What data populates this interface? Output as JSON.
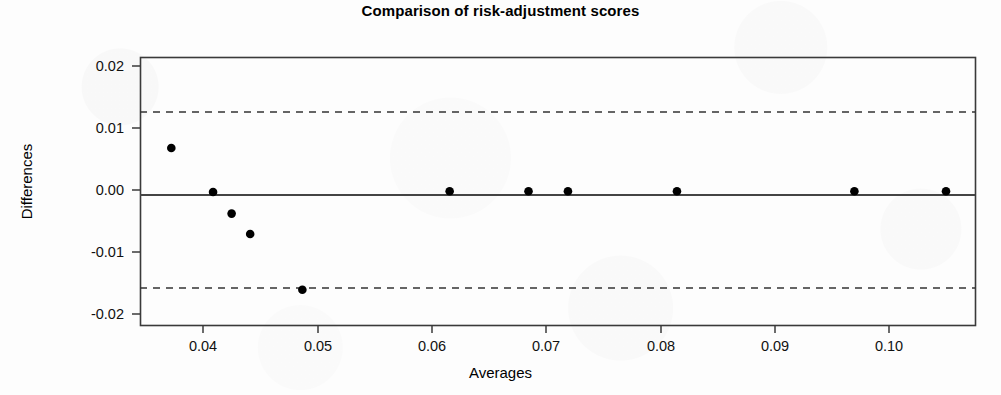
{
  "chart_data": {
    "type": "scatter",
    "title": "Comparison of risk-adjustment scores",
    "xlabel": "Averages",
    "ylabel": "Differences",
    "xlim": [
      0.0347,
      0.1067
    ],
    "ylim": [
      -0.0218,
      0.0215
    ],
    "grid": false,
    "legend": null,
    "xticks": [
      0.04,
      0.05,
      0.06,
      0.07,
      0.08,
      0.09,
      0.1
    ],
    "xtick_labels": [
      "0.04",
      "0.05",
      "0.06",
      "0.07",
      "0.08",
      "0.09",
      "0.10"
    ],
    "yticks": [
      0.02,
      0.01,
      0.0,
      -0.01,
      -0.02
    ],
    "ytick_labels": [
      "0.02",
      "0.01",
      "0.00",
      "-0.01",
      "-0.02"
    ],
    "series": [
      {
        "name": "differences",
        "marker": "filled-circle",
        "color": "#000000",
        "x": [
          0.0374,
          0.041,
          0.0426,
          0.0442,
          0.0487,
          0.0614,
          0.0682,
          0.0716,
          0.081,
          0.0963,
          0.1042
        ],
        "y": [
          0.0068,
          -0.0003,
          -0.0038,
          -0.0071,
          -0.0161,
          -0.0002,
          -0.0002,
          -0.0002,
          -0.0002,
          -0.0002,
          -0.0002
        ]
      }
    ],
    "reference_lines": [
      {
        "name": "upper-limit-of-agreement",
        "value": 0.0126,
        "style": "dashed",
        "color": "#333333"
      },
      {
        "name": "mean-difference",
        "value": -0.0008,
        "style": "solid",
        "color": "#444444"
      },
      {
        "name": "lower-limit-of-agreement",
        "value": -0.0158,
        "style": "dashed",
        "color": "#333333"
      }
    ],
    "annotations": []
  },
  "colors": {
    "background": "#fdfdfd",
    "frame": "#3a3a3a",
    "point": "#000000",
    "dashed_line": "#333333",
    "mean_line": "#444444",
    "text": "#000000"
  }
}
